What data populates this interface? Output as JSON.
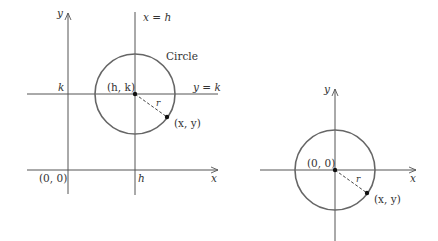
{
  "left_diagram": {
    "y_axis_label": "y",
    "x_axis_label": "x",
    "vertical_line_label": "x = h",
    "horizontal_line_label": "y = k",
    "circle_label": "Circle",
    "k_label": "k",
    "h_label": "h",
    "origin_label": "(0, 0)",
    "center_label": "(h, k)",
    "point_label": "(x, y)",
    "radius_label": "r"
  },
  "right_diagram": {
    "y_axis_label": "y",
    "x_axis_label": "x",
    "center_label": "(0, 0)",
    "point_label": "(x, y)",
    "radius_label": "r"
  },
  "colors": {
    "axis": "#555555",
    "circle": "#666666",
    "text": "#333333"
  }
}
